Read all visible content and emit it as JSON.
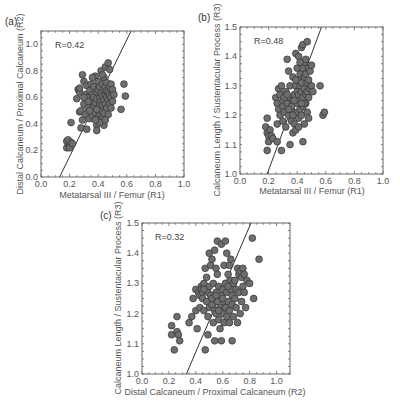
{
  "chart_data": [
    {
      "id": "a",
      "type": "scatter",
      "panel_label": "(a)",
      "title": "",
      "annotation": "R=0.42",
      "xlabel": "Metatarsal III / Femur (R1)",
      "ylabel": "Distal Calcaneum / Proximal Calcaneum (R2)",
      "xlim": [
        0.0,
        1.0
      ],
      "ylim": [
        0.0,
        1.1
      ],
      "xticks": [
        "0.0",
        "0.2",
        "0.4",
        "0.6",
        "0.8",
        "1.0"
      ],
      "yticks": [
        "0.0",
        "0.2",
        "0.4",
        "0.6",
        "0.8",
        "1.0"
      ],
      "xtick_values": [
        0.0,
        0.2,
        0.4,
        0.6,
        0.8,
        1.0
      ],
      "ytick_values": [
        0.0,
        0.2,
        0.4,
        0.6,
        0.8,
        1.0
      ],
      "fit_line": [
        [
          0.13,
          0.0
        ],
        [
          0.63,
          1.1
        ]
      ],
      "points": [
        [
          0.18,
          0.22
        ],
        [
          0.19,
          0.25
        ],
        [
          0.18,
          0.27
        ],
        [
          0.2,
          0.24
        ],
        [
          0.19,
          0.28
        ],
        [
          0.21,
          0.26
        ],
        [
          0.2,
          0.22
        ],
        [
          0.22,
          0.25
        ],
        [
          0.21,
          0.41
        ],
        [
          0.25,
          0.59
        ],
        [
          0.26,
          0.66
        ],
        [
          0.27,
          0.64
        ],
        [
          0.27,
          0.49
        ],
        [
          0.28,
          0.5
        ],
        [
          0.28,
          0.37
        ],
        [
          0.29,
          0.43
        ],
        [
          0.29,
          0.77
        ],
        [
          0.3,
          0.72
        ],
        [
          0.3,
          0.55
        ],
        [
          0.31,
          0.62
        ],
        [
          0.31,
          0.47
        ],
        [
          0.32,
          0.36
        ],
        [
          0.32,
          0.69
        ],
        [
          0.33,
          0.6
        ],
        [
          0.33,
          0.52
        ],
        [
          0.34,
          0.44
        ],
        [
          0.34,
          0.65
        ],
        [
          0.35,
          0.7
        ],
        [
          0.35,
          0.57
        ],
        [
          0.35,
          0.5
        ],
        [
          0.36,
          0.62
        ],
        [
          0.36,
          0.46
        ],
        [
          0.37,
          0.53
        ],
        [
          0.37,
          0.68
        ],
        [
          0.37,
          0.6
        ],
        [
          0.38,
          0.56
        ],
        [
          0.38,
          0.76
        ],
        [
          0.38,
          0.48
        ],
        [
          0.39,
          0.64
        ],
        [
          0.39,
          0.59
        ],
        [
          0.39,
          0.39
        ],
        [
          0.39,
          0.35
        ],
        [
          0.4,
          0.72
        ],
        [
          0.4,
          0.52
        ],
        [
          0.4,
          0.66
        ],
        [
          0.4,
          0.45
        ],
        [
          0.41,
          0.6
        ],
        [
          0.41,
          0.55
        ],
        [
          0.41,
          0.68
        ],
        [
          0.41,
          0.48
        ],
        [
          0.42,
          0.63
        ],
        [
          0.42,
          0.57
        ],
        [
          0.42,
          0.8
        ],
        [
          0.42,
          0.5
        ],
        [
          0.43,
          0.61
        ],
        [
          0.43,
          0.7
        ],
        [
          0.43,
          0.54
        ],
        [
          0.43,
          0.44
        ],
        [
          0.44,
          0.66
        ],
        [
          0.44,
          0.58
        ],
        [
          0.44,
          0.75
        ],
        [
          0.44,
          0.39
        ],
        [
          0.44,
          0.48
        ],
        [
          0.45,
          0.62
        ],
        [
          0.45,
          0.55
        ],
        [
          0.45,
          0.68
        ],
        [
          0.45,
          0.83
        ],
        [
          0.46,
          0.6
        ],
        [
          0.46,
          0.71
        ],
        [
          0.46,
          0.52
        ],
        [
          0.46,
          0.65
        ],
        [
          0.47,
          0.86
        ],
        [
          0.47,
          0.58
        ],
        [
          0.47,
          0.64
        ],
        [
          0.47,
          0.47
        ],
        [
          0.48,
          0.68
        ],
        [
          0.48,
          0.55
        ],
        [
          0.48,
          0.81
        ],
        [
          0.48,
          0.62
        ],
        [
          0.49,
          0.6
        ],
        [
          0.49,
          0.7
        ],
        [
          0.49,
          0.52
        ],
        [
          0.5,
          0.64
        ],
        [
          0.5,
          0.57
        ],
        [
          0.5,
          0.66
        ],
        [
          0.51,
          0.62
        ],
        [
          0.36,
          0.75
        ],
        [
          0.33,
          0.57
        ],
        [
          0.41,
          0.41
        ],
        [
          0.38,
          0.43
        ],
        [
          0.56,
          0.51
        ],
        [
          0.58,
          0.7
        ],
        [
          0.59,
          0.61
        ],
        [
          0.27,
          0.67
        ],
        [
          0.3,
          0.6
        ],
        [
          0.34,
          0.5
        ],
        [
          0.43,
          0.77
        ],
        [
          0.45,
          0.43
        ],
        [
          0.39,
          0.51
        ]
      ]
    },
    {
      "id": "b",
      "type": "scatter",
      "panel_label": "(b)",
      "title": "",
      "annotation": "R=0.48",
      "xlabel": "Metatarsal III / Femur (R1)",
      "ylabel": "Calcaneum Length / Sustentacular Process (R3)",
      "xlim": [
        0.0,
        1.0
      ],
      "ylim": [
        1.0,
        1.5
      ],
      "xticks": [
        "0.0",
        "0.2",
        "0.4",
        "0.6",
        "0.8",
        "1.0"
      ],
      "yticks": [
        "1.0",
        "1.1",
        "1.2",
        "1.3",
        "1.4",
        "1.5"
      ],
      "xtick_values": [
        0.0,
        0.2,
        0.4,
        0.6,
        0.8,
        1.0
      ],
      "ytick_values": [
        1.0,
        1.1,
        1.2,
        1.3,
        1.4,
        1.5
      ],
      "fit_line": [
        [
          0.19,
          1.0
        ],
        [
          0.57,
          1.5
        ]
      ],
      "points": [
        [
          0.18,
          1.16
        ],
        [
          0.19,
          1.19
        ],
        [
          0.19,
          1.14
        ],
        [
          0.19,
          1.08
        ],
        [
          0.2,
          1.13
        ],
        [
          0.21,
          1.15
        ],
        [
          0.2,
          1.11
        ],
        [
          0.22,
          1.13
        ],
        [
          0.23,
          1.12
        ],
        [
          0.25,
          1.26
        ],
        [
          0.26,
          1.24
        ],
        [
          0.26,
          1.17
        ],
        [
          0.26,
          1.11
        ],
        [
          0.27,
          1.29
        ],
        [
          0.27,
          1.22
        ],
        [
          0.28,
          1.2
        ],
        [
          0.28,
          1.27
        ],
        [
          0.29,
          1.08
        ],
        [
          0.3,
          1.25
        ],
        [
          0.3,
          1.18
        ],
        [
          0.3,
          1.23
        ],
        [
          0.31,
          1.21
        ],
        [
          0.32,
          1.28
        ],
        [
          0.32,
          1.16
        ],
        [
          0.33,
          1.39
        ],
        [
          0.33,
          1.24
        ],
        [
          0.34,
          1.35
        ],
        [
          0.34,
          1.2
        ],
        [
          0.35,
          1.1
        ],
        [
          0.35,
          1.26
        ],
        [
          0.35,
          1.3
        ],
        [
          0.36,
          1.22
        ],
        [
          0.36,
          1.18
        ],
        [
          0.37,
          1.25
        ],
        [
          0.37,
          1.14
        ],
        [
          0.37,
          1.33
        ],
        [
          0.38,
          1.27
        ],
        [
          0.38,
          1.2
        ],
        [
          0.38,
          1.17
        ],
        [
          0.39,
          1.3
        ],
        [
          0.39,
          1.41
        ],
        [
          0.39,
          1.15
        ],
        [
          0.4,
          1.24
        ],
        [
          0.4,
          1.36
        ],
        [
          0.4,
          1.28
        ],
        [
          0.4,
          1.21
        ],
        [
          0.41,
          1.32
        ],
        [
          0.41,
          1.27
        ],
        [
          0.41,
          1.4
        ],
        [
          0.41,
          1.19
        ],
        [
          0.42,
          1.25
        ],
        [
          0.42,
          1.3
        ],
        [
          0.42,
          1.34
        ],
        [
          0.42,
          1.22
        ],
        [
          0.43,
          1.43
        ],
        [
          0.43,
          1.28
        ],
        [
          0.43,
          1.31
        ],
        [
          0.43,
          1.2
        ],
        [
          0.44,
          1.36
        ],
        [
          0.44,
          1.26
        ],
        [
          0.44,
          1.44
        ],
        [
          0.44,
          1.11
        ],
        [
          0.44,
          1.23
        ],
        [
          0.45,
          1.33
        ],
        [
          0.45,
          1.29
        ],
        [
          0.45,
          1.38
        ],
        [
          0.45,
          1.17
        ],
        [
          0.46,
          1.34
        ],
        [
          0.46,
          1.27
        ],
        [
          0.46,
          1.24
        ],
        [
          0.46,
          1.39
        ],
        [
          0.47,
          1.45
        ],
        [
          0.47,
          1.31
        ],
        [
          0.47,
          1.28
        ],
        [
          0.47,
          1.21
        ],
        [
          0.48,
          1.36
        ],
        [
          0.48,
          1.26
        ],
        [
          0.48,
          1.32
        ],
        [
          0.48,
          1.19
        ],
        [
          0.49,
          1.35
        ],
        [
          0.49,
          1.29
        ],
        [
          0.5,
          1.3
        ],
        [
          0.5,
          1.37
        ],
        [
          0.51,
          1.28
        ],
        [
          0.31,
          1.26
        ],
        [
          0.33,
          1.27
        ],
        [
          0.36,
          1.23
        ],
        [
          0.39,
          1.32
        ],
        [
          0.42,
          1.38
        ],
        [
          0.45,
          1.24
        ],
        [
          0.56,
          1.3
        ],
        [
          0.58,
          1.2
        ],
        [
          0.59,
          1.21
        ],
        [
          0.29,
          1.3
        ],
        [
          0.34,
          1.22
        ],
        [
          0.38,
          1.25
        ],
        [
          0.43,
          1.24
        ],
        [
          0.41,
          1.16
        ],
        [
          0.37,
          1.2
        ]
      ]
    },
    {
      "id": "c",
      "type": "scatter",
      "panel_label": "(c)",
      "title": "",
      "annotation": "R=0.32",
      "xlabel": "Distal Calcaneum / Proximal Calcaneum (R2)",
      "ylabel": "Calcaneum Length / Sustentacular Process (R3)",
      "xlim": [
        0.0,
        1.1
      ],
      "ylim": [
        1.0,
        1.5
      ],
      "xticks": [
        "0.0",
        "0.2",
        "0.4",
        "0.6",
        "0.8",
        "1.0"
      ],
      "yticks": [
        "1.0",
        "1.1",
        "1.2",
        "1.3",
        "1.4",
        "1.5"
      ],
      "xtick_values": [
        0.0,
        0.2,
        0.4,
        0.6,
        0.8,
        1.0
      ],
      "ytick_values": [
        1.0,
        1.1,
        1.2,
        1.3,
        1.4,
        1.5
      ],
      "fit_line": [
        [
          0.33,
          1.0
        ],
        [
          0.81,
          1.5
        ]
      ],
      "points": [
        [
          0.22,
          1.16
        ],
        [
          0.22,
          1.13
        ],
        [
          0.24,
          1.08
        ],
        [
          0.26,
          1.19
        ],
        [
          0.26,
          1.14
        ],
        [
          0.27,
          1.13
        ],
        [
          0.28,
          1.11
        ],
        [
          0.35,
          1.17
        ],
        [
          0.37,
          1.19
        ],
        [
          0.38,
          1.25
        ],
        [
          0.4,
          1.28
        ],
        [
          0.4,
          1.21
        ],
        [
          0.41,
          1.15
        ],
        [
          0.42,
          1.27
        ],
        [
          0.43,
          1.26
        ],
        [
          0.43,
          1.22
        ],
        [
          0.44,
          1.29
        ],
        [
          0.44,
          1.28
        ],
        [
          0.45,
          1.27
        ],
        [
          0.45,
          1.25
        ],
        [
          0.46,
          1.3
        ],
        [
          0.46,
          1.21
        ],
        [
          0.47,
          1.35
        ],
        [
          0.47,
          1.28
        ],
        [
          0.47,
          1.08
        ],
        [
          0.48,
          1.32
        ],
        [
          0.48,
          1.24
        ],
        [
          0.49,
          1.27
        ],
        [
          0.49,
          1.13
        ],
        [
          0.5,
          1.4
        ],
        [
          0.5,
          1.29
        ],
        [
          0.5,
          1.22
        ],
        [
          0.51,
          1.36
        ],
        [
          0.51,
          1.26
        ],
        [
          0.52,
          1.38
        ],
        [
          0.52,
          1.23
        ],
        [
          0.53,
          1.3
        ],
        [
          0.53,
          1.25
        ],
        [
          0.53,
          1.17
        ],
        [
          0.54,
          1.41
        ],
        [
          0.54,
          1.21
        ],
        [
          0.54,
          1.11
        ],
        [
          0.55,
          1.35
        ],
        [
          0.55,
          1.27
        ],
        [
          0.55,
          1.2
        ],
        [
          0.56,
          1.44
        ],
        [
          0.56,
          1.33
        ],
        [
          0.56,
          1.24
        ],
        [
          0.57,
          1.29
        ],
        [
          0.57,
          1.18
        ],
        [
          0.58,
          1.22
        ],
        [
          0.58,
          1.15
        ],
        [
          0.59,
          1.43
        ],
        [
          0.59,
          1.26
        ],
        [
          0.59,
          1.11
        ],
        [
          0.6,
          1.2
        ],
        [
          0.6,
          1.28
        ],
        [
          0.61,
          1.36
        ],
        [
          0.61,
          1.17
        ],
        [
          0.61,
          1.24
        ],
        [
          0.62,
          1.44
        ],
        [
          0.62,
          1.3
        ],
        [
          0.62,
          1.22
        ],
        [
          0.63,
          1.4
        ],
        [
          0.63,
          1.27
        ],
        [
          0.63,
          1.19
        ],
        [
          0.64,
          1.33
        ],
        [
          0.64,
          1.24
        ],
        [
          0.65,
          1.36
        ],
        [
          0.65,
          1.21
        ],
        [
          0.65,
          1.17
        ],
        [
          0.66,
          1.28
        ],
        [
          0.66,
          1.31
        ],
        [
          0.67,
          1.26
        ],
        [
          0.67,
          1.23
        ],
        [
          0.67,
          1.11
        ],
        [
          0.68,
          1.3
        ],
        [
          0.68,
          1.19
        ],
        [
          0.69,
          1.25
        ],
        [
          0.7,
          1.28
        ],
        [
          0.7,
          1.22
        ],
        [
          0.71,
          1.35
        ],
        [
          0.71,
          1.17
        ],
        [
          0.72,
          1.33
        ],
        [
          0.72,
          1.27
        ],
        [
          0.73,
          1.34
        ],
        [
          0.73,
          1.2
        ],
        [
          0.74,
          1.32
        ],
        [
          0.74,
          1.24
        ],
        [
          0.75,
          1.35
        ],
        [
          0.75,
          1.29
        ],
        [
          0.76,
          1.33
        ],
        [
          0.76,
          1.27
        ],
        [
          0.77,
          1.22
        ],
        [
          0.78,
          1.31
        ],
        [
          0.8,
          1.3
        ],
        [
          0.82,
          1.45
        ],
        [
          0.83,
          1.25
        ],
        [
          0.87,
          1.38
        ],
        [
          0.46,
          1.28
        ],
        [
          0.52,
          1.25
        ],
        [
          0.57,
          1.21
        ],
        [
          0.6,
          1.25
        ],
        [
          0.64,
          1.29
        ],
        [
          0.69,
          1.31
        ],
        [
          0.49,
          1.19
        ],
        [
          0.55,
          1.26
        ],
        [
          0.66,
          1.38
        ]
      ]
    }
  ]
}
